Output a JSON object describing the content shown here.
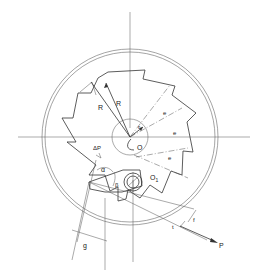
{
  "diagram": {
    "labels": {
      "R1": "R",
      "R2": "R",
      "r": "r",
      "O": "O",
      "O1": "O",
      "O1_sub": "1",
      "dP": "ΔP",
      "alpha": "α",
      "beta": "β",
      "g": "g",
      "f": "f",
      "t": "t",
      "P": "P",
      "e1": "e",
      "e2": "e",
      "e3": "e"
    },
    "colors": {
      "line": "#333333",
      "background": "#ffffff"
    }
  }
}
